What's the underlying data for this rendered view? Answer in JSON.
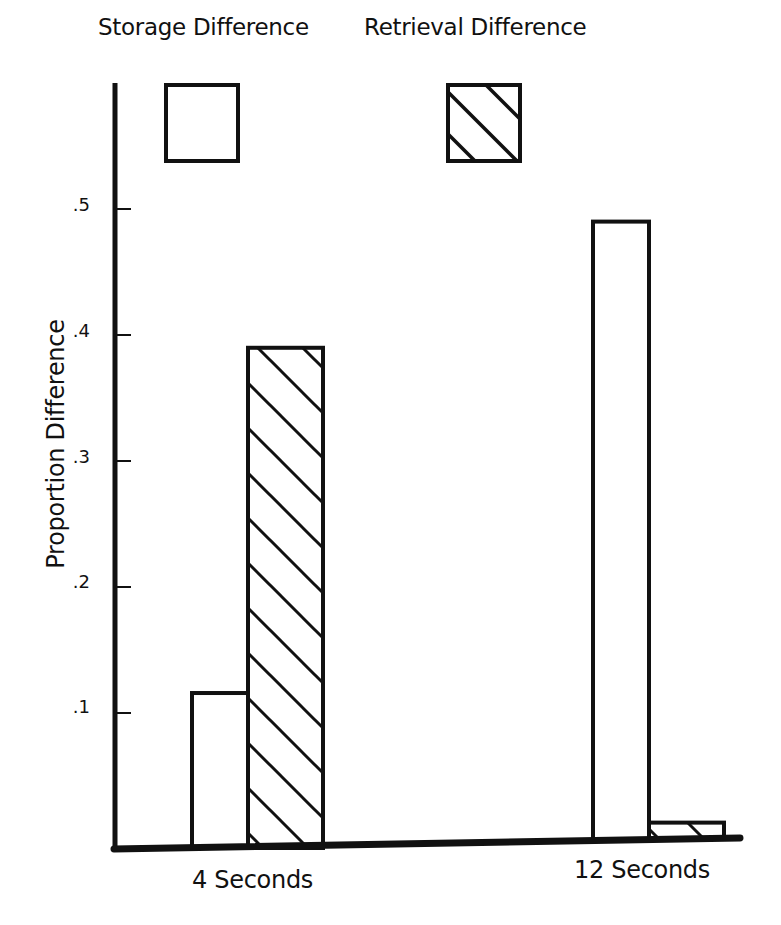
{
  "chart_data": {
    "type": "bar",
    "title": "",
    "xlabel": "",
    "ylabel": "Proportion Difference",
    "categories": [
      "4 Seconds",
      "12 Seconds"
    ],
    "series": [
      {
        "name": "Storage Difference",
        "pattern": "open",
        "values": [
          0.123,
          0.49
        ]
      },
      {
        "name": "Retrieval Difference",
        "pattern": "diagonal-hatch",
        "values": [
          0.397,
          0.013
        ]
      }
    ],
    "yticks": [
      0.1,
      0.2,
      0.3,
      0.4,
      0.5
    ],
    "ytick_labels": [
      ".1",
      ".2",
      ".3",
      ".4",
      ".5"
    ],
    "ylim": [
      0,
      0.59
    ],
    "grid": false,
    "legend_position": "top"
  },
  "legend": {
    "items": [
      {
        "label": "Storage Difference",
        "pattern": "open"
      },
      {
        "label": "Retrieval Difference",
        "pattern": "diagonal-hatch"
      }
    ]
  },
  "axes": {
    "y_title": "Proportion Difference",
    "x_labels": [
      "4 Seconds",
      "12 Seconds"
    ],
    "y_tick_labels": [
      ".1",
      ".2",
      ".3",
      ".4",
      ".5"
    ]
  },
  "colors": {
    "ink": "#111111",
    "fill": "#ffffff"
  }
}
